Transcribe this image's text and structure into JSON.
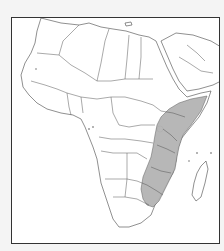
{
  "map": {
    "type": "species-distribution-range-map",
    "region": "Africa and Arabian Peninsula",
    "range_color": "#b4b4b4",
    "land_color": "#ffffff",
    "border_color": "#444444",
    "background_color": "#f4f4f4",
    "range_description": "Eastern and southeastern Africa: Somalia, southern Ethiopia, Kenya, Tanzania, Malawi, Mozambique, Zimbabwe, northeastern South Africa",
    "labels": []
  }
}
